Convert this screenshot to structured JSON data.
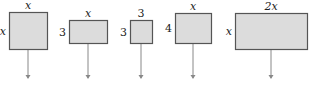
{
  "diagram": {
    "type": "area-tiles",
    "fill_color": "#dcdcdc",
    "stroke_color": "#555555",
    "arrow_color": "#888888",
    "tiles": [
      {
        "top_label": "x",
        "side_label": "x",
        "top_italic": true,
        "side_italic": true,
        "x": 9,
        "y": 12,
        "w": 38,
        "h": 37,
        "arrow_x": 28
      },
      {
        "top_label": "x",
        "side_label": "3",
        "top_italic": true,
        "side_italic": false,
        "x": 69,
        "y": 20,
        "w": 38,
        "h": 23,
        "arrow_x": 88
      },
      {
        "top_label": "3",
        "side_label": "3",
        "top_italic": false,
        "side_italic": false,
        "x": 130,
        "y": 20,
        "w": 22,
        "h": 23,
        "arrow_x": 141
      },
      {
        "top_label": "x",
        "side_label": "4",
        "top_italic": true,
        "side_italic": false,
        "x": 175,
        "y": 13,
        "w": 36,
        "h": 30,
        "arrow_x": 193
      },
      {
        "top_label": "2x",
        "side_label": "x",
        "top_italic": true,
        "side_italic": true,
        "x": 235,
        "y": 13,
        "w": 72,
        "h": 36,
        "arrow_x": 271
      }
    ],
    "arrow_end_y": 79
  }
}
